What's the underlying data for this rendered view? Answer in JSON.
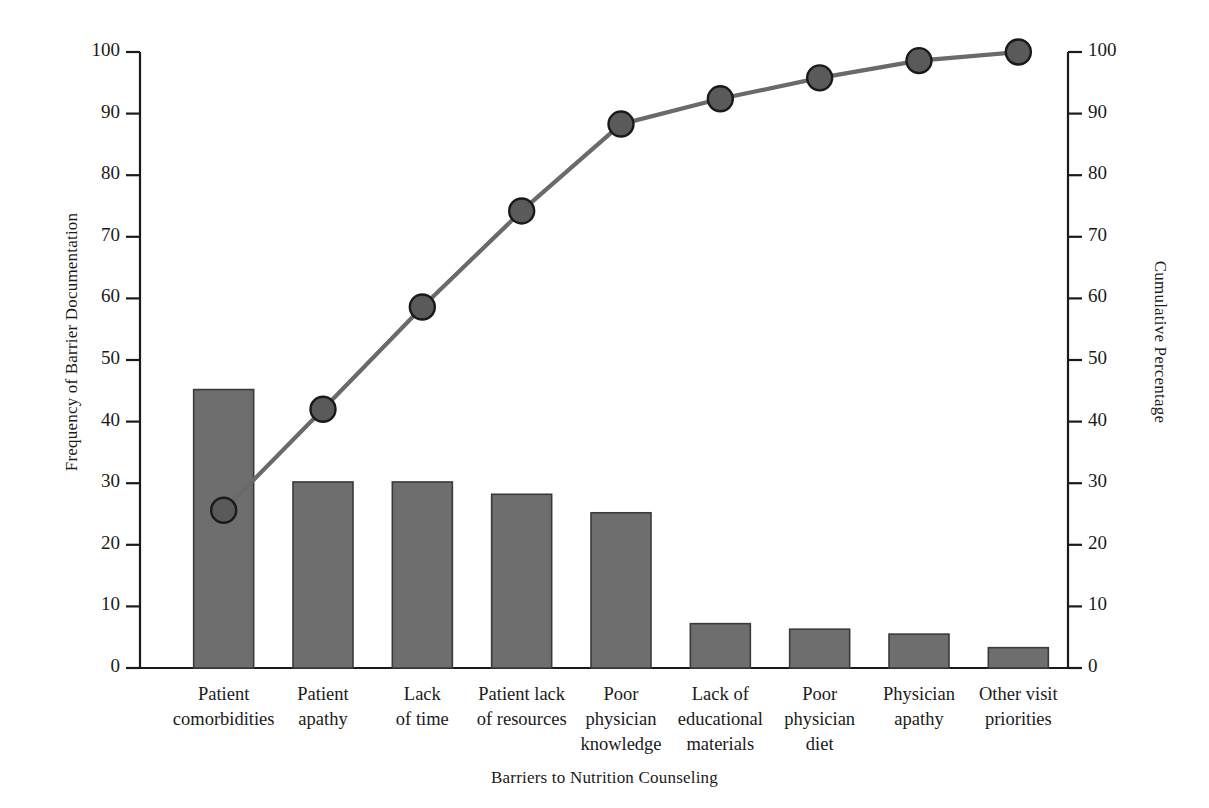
{
  "chart_data": {
    "type": "bar",
    "variant": "pareto",
    "title": "",
    "xlabel": "Barriers to Nutrition Counseling",
    "ylabel": "Frequency of Barrier Documentation",
    "y2label": "Cumulative Percentage",
    "categories": [
      "Patient\ncomorbidities",
      "Patient\napathy",
      "Lack\nof time",
      "Patient lack\nof resources",
      "Poor\nphysician\nknowledge",
      "Lack of\neducational\nmaterials",
      "Poor\nphysician\ndiet",
      "Physician\napathy",
      "Other visit\npriorities"
    ],
    "category_lines": [
      [
        "Patient",
        "comorbidities"
      ],
      [
        "Patient",
        "apathy"
      ],
      [
        "Lack",
        "of time"
      ],
      [
        "Patient lack",
        "of resources"
      ],
      [
        "Poor",
        "physician",
        "knowledge"
      ],
      [
        "Lack of",
        "educational",
        "materials"
      ],
      [
        "Poor",
        "physician",
        "diet"
      ],
      [
        "Physician",
        "apathy"
      ],
      [
        "Other visit",
        "priorities"
      ]
    ],
    "values": [
      45.2,
      30.2,
      30.2,
      28.2,
      25.2,
      7.2,
      6.3,
      5.5,
      3.3
    ],
    "cumulative_percent": [
      25.6,
      42.0,
      58.6,
      74.2,
      88.3,
      92.4,
      95.8,
      98.6,
      100.0
    ],
    "ylim": [
      0,
      100
    ],
    "y2lim": [
      0,
      100
    ],
    "yticks": [
      0,
      10,
      20,
      30,
      40,
      50,
      60,
      70,
      80,
      90,
      100
    ],
    "y2ticks": [
      0,
      10,
      20,
      30,
      40,
      50,
      60,
      70,
      80,
      90,
      100
    ],
    "ytick_labels": [
      "0",
      "10",
      "20",
      "30",
      "40",
      "50",
      "60",
      "70",
      "80",
      "90",
      "100"
    ],
    "y2tick_labels": [
      "0",
      "10",
      "20",
      "30",
      "40",
      "50",
      "60",
      "70",
      "80",
      "90",
      "100"
    ],
    "grid": false,
    "legend": "none",
    "colors": {
      "bar_fill": "#6e6e6e",
      "bar_stroke": "#3a3a3a",
      "line": "#6a6a6a",
      "marker_fill": "#5a5a5a",
      "marker_stroke": "#1a1a1a",
      "axis": "#1a1a1a",
      "background": "#ffffff"
    }
  }
}
